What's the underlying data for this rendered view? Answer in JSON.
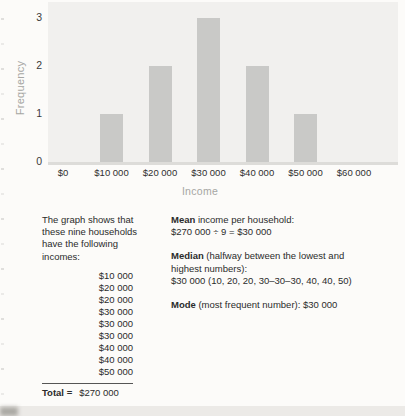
{
  "chart_data": {
    "type": "bar",
    "categories": [
      "$10 000",
      "$20 000",
      "$30 000",
      "$40 000",
      "$50 000"
    ],
    "values": [
      1,
      2,
      3,
      2,
      1
    ],
    "x_ticks": [
      "$0",
      "$10 000",
      "$20 000",
      "$30 000",
      "$40 000",
      "$50 000",
      "$60 000"
    ],
    "y_ticks": [
      0,
      1,
      2,
      3
    ],
    "xlabel": "Income",
    "ylabel": "Frequency",
    "ylim": [
      0,
      3
    ],
    "grid": false,
    "legend": false,
    "bar_color": "#c9c9c7",
    "plot_bg": "#f1f0ee"
  },
  "left_column": {
    "intro_lines": [
      "The graph shows that",
      "these nine households",
      "have the following",
      "incomes:"
    ],
    "incomes": [
      "$10 000",
      "$20 000",
      "$20 000",
      "$30 000",
      "$30 000",
      "$30 000",
      "$40 000",
      "$40 000",
      "$50 000"
    ],
    "total_label": "Total =",
    "total_value": "$270 000"
  },
  "right_column": {
    "mean": {
      "label": "Mean",
      "rest": " income per household:",
      "line2": "$270 000 ÷ 9 = $30 000"
    },
    "median": {
      "label": "Median",
      "rest": " (halfway between the lowest and",
      "line2": "highest numbers):",
      "line3": "$30 000 (10, 20, 20, 30–30–30, 40, 40, 50)"
    },
    "mode": {
      "label": "Mode",
      "rest": " (most frequent number): $30 000"
    }
  }
}
